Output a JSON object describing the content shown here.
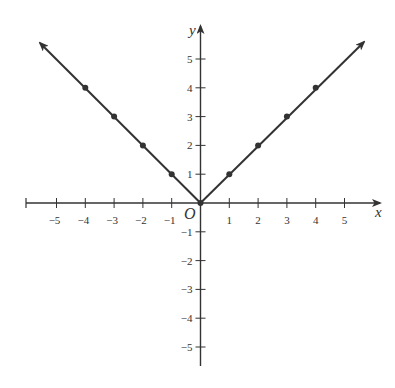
{
  "chart_data": {
    "type": "line",
    "title": "",
    "function": "y = |x|",
    "xlabel": "x",
    "ylabel": "y",
    "origin_label": "O",
    "xlim": [
      -6,
      6
    ],
    "ylim": [
      -5.5,
      6
    ],
    "x_ticks": [
      -5,
      -4,
      -3,
      -2,
      -1,
      1,
      2,
      3,
      4,
      5
    ],
    "y_ticks": [
      5,
      4,
      3,
      2,
      1,
      -1,
      -2,
      -3,
      -4,
      -5
    ],
    "grid": false,
    "series": [
      {
        "name": "y = |x|",
        "x": [
          -4,
          -3,
          -2,
          -1,
          0,
          1,
          2,
          3,
          4
        ],
        "values": [
          4,
          3,
          2,
          1,
          0,
          1,
          2,
          3,
          4
        ],
        "marked_points": [
          [
            -4,
            4
          ],
          [
            -3,
            3
          ],
          [
            -2,
            2
          ],
          [
            -1,
            1
          ],
          [
            0,
            0
          ],
          [
            1,
            1
          ],
          [
            2,
            2
          ],
          [
            3,
            3
          ],
          [
            4,
            4
          ]
        ],
        "extends_with_arrows": true
      }
    ],
    "colors": {
      "line": "#333333",
      "axis": "#333333"
    }
  }
}
